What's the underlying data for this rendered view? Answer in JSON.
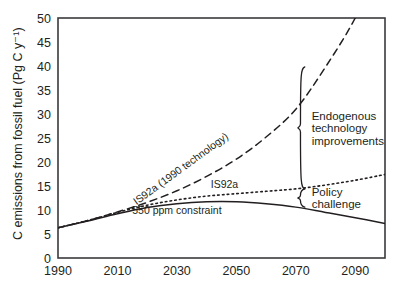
{
  "chart_data": {
    "type": "line",
    "title": "",
    "xlabel": "",
    "ylabel": "C emissions from fossil fuel (Pg C y⁻¹)",
    "xlim": [
      1990,
      2100
    ],
    "ylim": [
      0,
      50
    ],
    "grid": false,
    "legend_position": "inline-labels",
    "xticks": [
      "1990",
      "2010",
      "2030",
      "2050",
      "2070",
      "2090"
    ],
    "xtick_values": [
      1990,
      2010,
      2030,
      2050,
      2070,
      2090
    ],
    "yticks": [
      "0",
      "5",
      "10",
      "15",
      "20",
      "25",
      "30",
      "35",
      "40",
      "45",
      "50"
    ],
    "ytick_values": [
      0,
      5,
      10,
      15,
      20,
      25,
      30,
      35,
      40,
      45,
      50
    ],
    "x": [
      1990,
      2000,
      2010,
      2020,
      2030,
      2040,
      2050,
      2060,
      2070,
      2080,
      2090,
      2100
    ],
    "series": [
      {
        "name": "IS92a (1990 technology)",
        "style": "dashed",
        "values": [
          6.3,
          7.8,
          9.6,
          11.6,
          14.0,
          17.0,
          20.6,
          25.2,
          31.0,
          39.8,
          50.0,
          63.0
        ],
        "label_text": "IS92a (1990 technology)",
        "label_x": 2032,
        "label_y": 18.0,
        "label_rotation": -36
      },
      {
        "name": "IS92a",
        "style": "dotted",
        "values": [
          6.3,
          7.8,
          9.5,
          11.0,
          12.1,
          12.9,
          13.4,
          13.9,
          14.4,
          15.2,
          16.2,
          17.4
        ],
        "label_text": "IS92a",
        "label_x": 2046,
        "label_y": 14.6,
        "label_rotation": 0
      },
      {
        "name": "550 ppm constraint",
        "style": "solid",
        "values": [
          6.3,
          7.7,
          9.2,
          10.5,
          11.3,
          11.7,
          11.7,
          11.3,
          10.6,
          9.5,
          8.4,
          7.2
        ],
        "label_text": "550 ppm constraint",
        "label_x": 2030,
        "label_y": 9.2,
        "label_rotation": 0
      }
    ],
    "annotations": [
      {
        "name": "endogenous-technology-improvements",
        "lines": [
          "Endogenous",
          "technology",
          "improvements"
        ],
        "brace_x": 2070,
        "brace_top": 39.8,
        "brace_bottom": 14.4,
        "text_x": 2074,
        "text_y": 27.0
      },
      {
        "name": "policy-challenge",
        "lines": [
          "Policy",
          "challenge"
        ],
        "brace_x": 2070,
        "brace_top": 14.4,
        "brace_bottom": 10.6,
        "text_x": 2074,
        "text_y": 12.5
      }
    ],
    "colors": {
      "ink": "#231f20",
      "frame": "#3a3a3c",
      "background": "#ffffff"
    }
  }
}
